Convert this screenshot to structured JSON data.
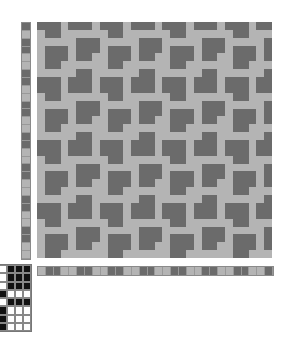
{
  "colors": {
    "dark": "#6b6b6b",
    "light": "#b4b4b4",
    "tie_on": "#111111",
    "tie_off": "#ffffff"
  },
  "pattern_tile": [
    "DDDLDDDL",
    "LDDLLLLL",
    "LLLLLDDD",
    "LDDDLDDD",
    "LDDDLDDL",
    "LDDLLLLL",
    "LLLLLDDL",
    "DDDLDDDL"
  ],
  "grid": {
    "cols": 30,
    "rows": 30
  },
  "weft_colors": "DLDDLLDDLLDDLLDDLLDDLLDDLLDDLL",
  "warp_colors": "LDDLLDDLLDDLLDDLLDDLLDDLLDDLLD",
  "tieup": [
    "0111",
    "0111",
    "0111",
    "1000",
    "0111",
    "1000",
    "1000",
    "1000"
  ]
}
